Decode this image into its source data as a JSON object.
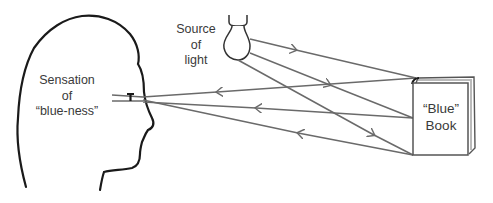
{
  "diagram": {
    "type": "light-reflection-perception",
    "labels": {
      "sensation": [
        "Sensation",
        "of",
        "“blue-ness”"
      ],
      "source": [
        "Source",
        "of",
        "light"
      ],
      "book": [
        "“Blue”",
        "Book"
      ]
    },
    "elements": [
      {
        "id": "head",
        "kind": "head-profile-outline",
        "icon": "head-profile-icon"
      },
      {
        "id": "eye",
        "kind": "eye-marker",
        "icon": "eye-icon"
      },
      {
        "id": "bulb",
        "kind": "light-bulb",
        "icon": "light-bulb-icon"
      },
      {
        "id": "book",
        "kind": "book",
        "icon": "book-icon"
      }
    ],
    "rays": {
      "incident": [
        {
          "from": "bulb",
          "to": "book-top",
          "direction": "toward-book"
        },
        {
          "from": "bulb",
          "to": "book-middle",
          "direction": "toward-book"
        },
        {
          "from": "bulb",
          "to": "book-bottom",
          "direction": "toward-book"
        }
      ],
      "reflected": [
        {
          "from": "book-top",
          "to": "eye",
          "direction": "toward-eye"
        },
        {
          "from": "book-middle",
          "to": "eye",
          "direction": "toward-eye"
        },
        {
          "from": "book-bottom",
          "to": "eye",
          "direction": "toward-eye"
        }
      ]
    },
    "colors": {
      "outline": "#1a1a1a",
      "ray": "#6a6a6a",
      "text": "#3a3a3a",
      "background": "#ffffff"
    }
  }
}
